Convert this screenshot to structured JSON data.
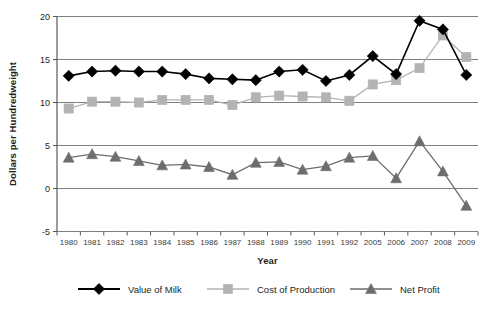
{
  "chart_data": {
    "type": "line",
    "title": "",
    "xlabel": "Year",
    "ylabel": "Dollars per Hundredweight",
    "categories": [
      "1980",
      "1981",
      "1982",
      "1983",
      "1984",
      "1985",
      "1986",
      "1987",
      "1988",
      "1989",
      "1990",
      "1991",
      "1992",
      "2005",
      "2006",
      "2007",
      "2008",
      "2009"
    ],
    "ylim": [
      -5,
      20
    ],
    "yticks": [
      -5,
      0,
      5,
      10,
      15,
      20
    ],
    "ytick_labels": [
      "-5",
      "0",
      "5",
      "10",
      "15",
      "20"
    ],
    "grid": true,
    "grid_axis": "y",
    "legend_position": "bottom",
    "series": [
      {
        "name": "Value of Milk",
        "marker": "diamond",
        "color": "#000000",
        "values": [
          13.1,
          13.6,
          13.7,
          13.6,
          13.6,
          13.3,
          12.8,
          12.7,
          12.6,
          13.6,
          13.8,
          12.5,
          13.2,
          15.4,
          13.3,
          19.5,
          18.5,
          13.2
        ]
      },
      {
        "name": "Cost of Production",
        "marker": "square",
        "color": "#b3b3b3",
        "values": [
          9.3,
          10.1,
          10.1,
          10.0,
          10.3,
          10.3,
          10.3,
          9.7,
          10.6,
          10.8,
          10.7,
          10.6,
          10.2,
          12.1,
          12.6,
          14.0,
          17.8,
          15.3
        ]
      },
      {
        "name": "Net Profit",
        "marker": "triangle",
        "color": "#6d6d6d",
        "values": [
          3.6,
          4.0,
          3.7,
          3.2,
          2.7,
          2.8,
          2.5,
          1.6,
          3.0,
          3.1,
          2.2,
          2.6,
          3.6,
          3.8,
          1.2,
          5.5,
          2.0,
          -2.0
        ]
      }
    ]
  },
  "colors": {
    "value_of_milk": "#000000",
    "cost_of_production": "#b3b3b3",
    "net_profit": "#6d6d6d",
    "axis": "#595959",
    "grid": "#808080",
    "text": "#231f20",
    "background": "#ffffff"
  },
  "legend": {
    "items": [
      {
        "label": "Value of Milk",
        "marker": "diamond-marker-icon",
        "color": "#000000"
      },
      {
        "label": "Cost of Production",
        "marker": "square-marker-icon",
        "color": "#b3b3b3"
      },
      {
        "label": "Net Profit",
        "marker": "triangle-marker-icon",
        "color": "#6d6d6d"
      }
    ]
  }
}
